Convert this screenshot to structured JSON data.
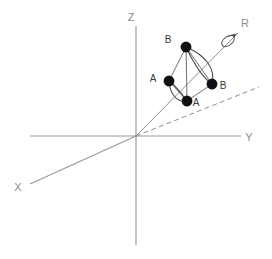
{
  "figure": {
    "background_color": "#ffffff",
    "width": 272,
    "height": 259
  },
  "axes": {
    "color": "#9a9a9a",
    "items": [
      {
        "id": "z",
        "label": "Z",
        "label_x": 128,
        "label_y": 21,
        "x1": 136,
        "y1": 26,
        "x2": 136,
        "y2": 245
      },
      {
        "id": "y",
        "label": "Y",
        "label_x": 245,
        "label_y": 141,
        "x1": 30,
        "y1": 136,
        "x2": 241,
        "y2": 136
      },
      {
        "id": "x",
        "label": "X",
        "label_x": 14,
        "label_y": 191,
        "x1": 136,
        "y1": 136,
        "x2": 30,
        "y2": 184
      }
    ]
  },
  "rotation_axis": {
    "id": "r",
    "label": "R",
    "label_x": 241,
    "label_y": 27,
    "color": "#8d8d8d",
    "x1": 136,
    "y1": 136,
    "x2": 238,
    "y2": 33,
    "arrow_symbol": "curved-rotation-arrow",
    "arrow_center_x": 228,
    "arrow_center_y": 41
  },
  "reference_line": {
    "id": "dashed-projection",
    "style": "dashed",
    "color": "#8d8d8d",
    "x1": 136,
    "y1": 136,
    "x2": 259,
    "y2": 87
  },
  "atoms": [
    {
      "id": "atom-b-top",
      "label": "B",
      "cx": 186,
      "cy": 47,
      "r": 5.2,
      "label_x": 168,
      "label_y": 43
    },
    {
      "id": "atom-a-left",
      "label": "A",
      "cx": 169,
      "cy": 81,
      "r": 5.2,
      "label_x": 153,
      "label_y": 82
    },
    {
      "id": "atom-b-right",
      "label": "B",
      "cx": 212,
      "cy": 84,
      "r": 5.2,
      "label_x": 221,
      "label_y": 88
    },
    {
      "id": "atom-a-bottom",
      "label": "A",
      "cx": 187,
      "cy": 101,
      "r": 5.2,
      "label_x": 193,
      "label_y": 105
    }
  ],
  "bonds": [
    {
      "id": "bond-btop-aleft",
      "from": "atom-b-top",
      "to": "atom-a-left",
      "type": "straight"
    },
    {
      "id": "bond-btop-bright",
      "from": "atom-b-top",
      "to": "atom-b-right",
      "type": "straight"
    },
    {
      "id": "bond-btop-abottom",
      "from": "atom-b-top",
      "to": "atom-a-bottom",
      "type": "straight"
    },
    {
      "id": "bond-aleft-abottom",
      "from": "atom-a-left",
      "to": "atom-a-bottom",
      "type": "straight"
    },
    {
      "id": "bond-bright-abottom",
      "from": "atom-b-right",
      "to": "atom-a-bottom",
      "type": "straight"
    }
  ],
  "arcs": [
    {
      "id": "arc-btop-bright-outer",
      "d": "M 186 47 C 205 55 216 68 212 84"
    },
    {
      "id": "arc-btop-bright-inner",
      "d": "M 186 47 C 195 66 203 78 212 84"
    },
    {
      "id": "arc-aleft-abottom-outer",
      "d": "M 169 81 C 172 94 179 102 187 101"
    },
    {
      "id": "arc-aleft-abottom-inner",
      "d": "M 169 81 C 176 87 182 95 187 101"
    }
  ],
  "legend_note": ""
}
